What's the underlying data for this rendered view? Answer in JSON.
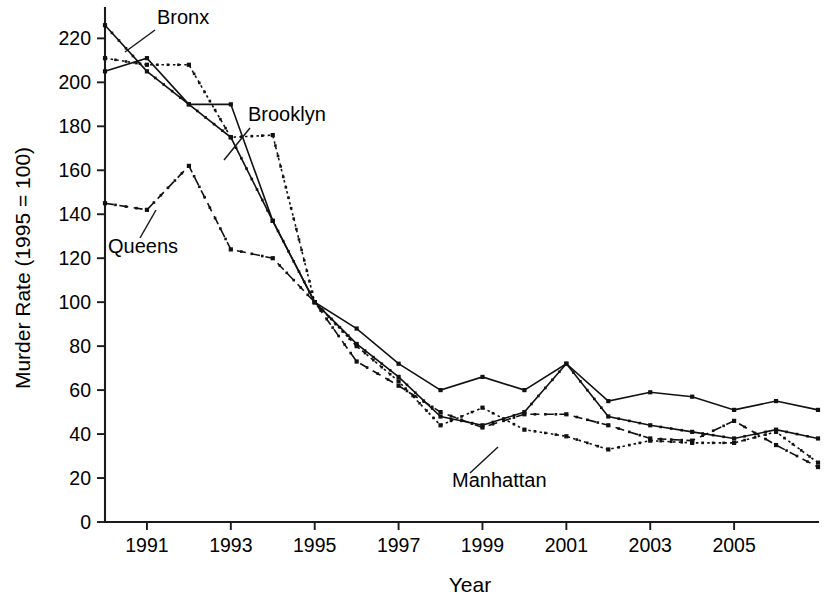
{
  "chart_data": {
    "type": "line",
    "title": "",
    "xlabel": "Year",
    "ylabel": "Murder Rate (1995 = 100)",
    "xlim": [
      1990,
      2007
    ],
    "ylim": [
      0,
      232
    ],
    "grid": false,
    "legend_position": "inline-annotations",
    "x": [
      1990,
      1991,
      1992,
      1993,
      1994,
      1995,
      1996,
      1997,
      1998,
      1999,
      2000,
      2001,
      2002,
      2003,
      2004,
      2005,
      2006,
      2007
    ],
    "x_tick_labels": [
      "1991",
      "1993",
      "1995",
      "1997",
      "1999",
      "2001",
      "2003",
      "2005"
    ],
    "x_tick_values": [
      1991,
      1993,
      1995,
      1997,
      1999,
      2001,
      2003,
      2005
    ],
    "y_tick_labels": [
      "0",
      "20",
      "40",
      "60",
      "80",
      "100",
      "120",
      "140",
      "160",
      "180",
      "200",
      "220"
    ],
    "y_tick_values": [
      0,
      20,
      40,
      60,
      80,
      100,
      120,
      140,
      160,
      180,
      200,
      220
    ],
    "series": [
      {
        "name": "Bronx",
        "style": "solid-with-dots",
        "label_text": "Bronx",
        "values": [
          226,
          205,
          190,
          175,
          137,
          100,
          81,
          66,
          48,
          44,
          50,
          72,
          48,
          44,
          41,
          38,
          42,
          38
        ]
      },
      {
        "name": "Brooklyn",
        "style": "solid",
        "label_text": "Brooklyn",
        "values": [
          205,
          211,
          190,
          190,
          137,
          100,
          88,
          72,
          60,
          66,
          60,
          72,
          55,
          59,
          57,
          51,
          55,
          51
        ]
      },
      {
        "name": "Manhattan",
        "style": "dotted",
        "label_text": "Manhattan",
        "values": [
          211,
          208,
          208,
          175,
          176,
          100,
          80,
          64,
          44,
          52,
          42,
          39,
          33,
          37,
          36,
          36,
          41,
          27
        ]
      },
      {
        "name": "Queens",
        "style": "dashed",
        "label_text": "Queens",
        "values": [
          145,
          142,
          162,
          124,
          120,
          100,
          73,
          62,
          50,
          43,
          49,
          49,
          44,
          38,
          37,
          46,
          35,
          25
        ]
      }
    ],
    "annotations": [
      {
        "name": "bronx-label",
        "text": "Bronx"
      },
      {
        "name": "brooklyn-label",
        "text": "Brooklyn"
      },
      {
        "name": "queens-label",
        "text": "Queens"
      },
      {
        "name": "manhattan-label",
        "text": "Manhattan"
      }
    ],
    "colors": {
      "axis": "#1a1a1a",
      "line": "#111111",
      "background": "#ffffff"
    }
  }
}
